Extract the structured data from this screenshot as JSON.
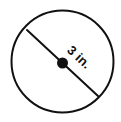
{
  "diagram": {
    "type": "circle-with-diameter",
    "background_color": "#ffffff",
    "stroke_color": "#111111",
    "shape": {
      "name": "circle",
      "center_x": 62.5,
      "center_y": 61.5,
      "radius": 51,
      "stroke_width": 2,
      "fill": "none"
    },
    "diameter_segment": {
      "name": "diameter",
      "x1": 27,
      "y1": 30,
      "x2": 98,
      "y2": 96,
      "stroke_width": 2,
      "angle_degrees": 43
    },
    "center_point": {
      "name": "center-point",
      "cx": 62.5,
      "cy": 63,
      "radius": 5.5,
      "fill": "#111111"
    },
    "label": {
      "text": "3 in.",
      "value": "3",
      "unit": "in.",
      "rotation_degrees": 43,
      "color": "#111111",
      "font_size": 13,
      "bold": true
    }
  }
}
